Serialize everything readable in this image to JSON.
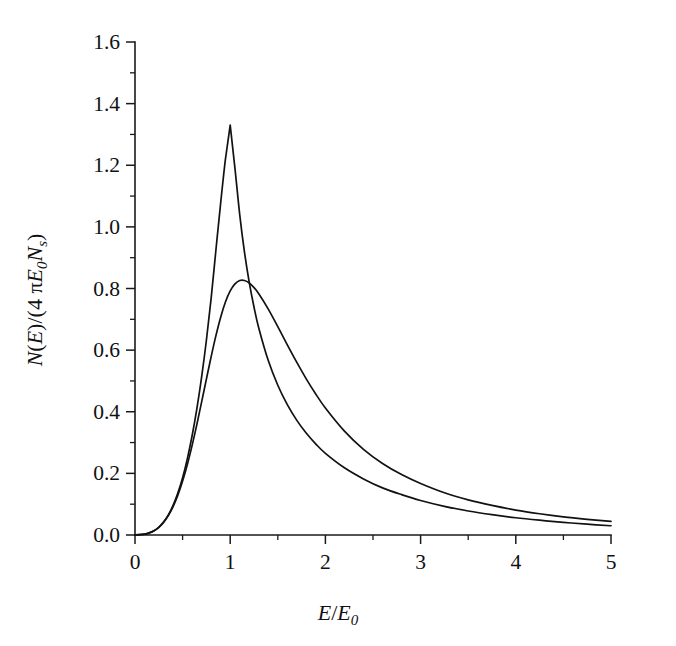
{
  "chart_data": {
    "type": "line",
    "title": "",
    "subtitle": "",
    "xlabel": "E/E_0",
    "xlabel_parts": {
      "numerator": "E",
      "slash": "/",
      "denominator": "E",
      "denominator_sub": "0"
    },
    "ylabel": "N(E)/(4 πE_0N_s)",
    "ylabel_parts": {
      "n": "N",
      "open": "(",
      "e": "E",
      "close": ")",
      "slash": "/",
      "paren_open": "(4 ",
      "pi": "π",
      "e0": "E",
      "e0_sub": "0",
      "ns": "N",
      "ns_sub": "s",
      "paren_close": ")"
    },
    "xlim": [
      0,
      5
    ],
    "ylim": [
      0.0,
      1.6
    ],
    "xticks": [
      0,
      1,
      2,
      3,
      4,
      5
    ],
    "xticklabels": [
      "0",
      "1",
      "2",
      "3",
      "4",
      "5"
    ],
    "yticks": [
      0.0,
      0.2,
      0.4,
      0.6,
      0.8,
      1.0,
      1.2,
      1.4,
      1.6
    ],
    "yticklabels": [
      "0.0",
      "0.2",
      "0.4",
      "0.6",
      "0.8",
      "1.0",
      "1.2",
      "1.4",
      "1.6"
    ],
    "x_minor_tick_interval": 0.5,
    "y_minor_tick_interval": 0.1,
    "grid": false,
    "legend": "none",
    "tick_direction": "out",
    "series": [
      {
        "name": "sharp-peak-curve",
        "peak_x": 1.0,
        "peak_y": 1.33,
        "x": [
          0.0,
          0.05,
          0.1,
          0.15,
          0.2,
          0.25,
          0.3,
          0.35,
          0.4,
          0.45,
          0.5,
          0.55,
          0.6,
          0.65,
          0.7,
          0.75,
          0.8,
          0.85,
          0.9,
          0.95,
          1.0,
          1.05,
          1.1,
          1.15,
          1.2,
          1.25,
          1.3,
          1.4,
          1.5,
          1.6,
          1.7,
          1.8,
          1.9,
          2.0,
          2.2,
          2.4,
          2.6,
          2.8,
          3.0,
          3.25,
          3.5,
          3.75,
          4.0,
          4.25,
          4.5,
          4.75,
          5.0
        ],
        "y": [
          0.0,
          0.001,
          0.003,
          0.007,
          0.014,
          0.025,
          0.042,
          0.065,
          0.096,
          0.136,
          0.186,
          0.248,
          0.322,
          0.41,
          0.513,
          0.632,
          0.769,
          0.925,
          1.078,
          1.22,
          1.33,
          1.19,
          1.04,
          0.918,
          0.82,
          0.74,
          0.672,
          0.566,
          0.486,
          0.423,
          0.372,
          0.33,
          0.295,
          0.265,
          0.218,
          0.182,
          0.153,
          0.131,
          0.112,
          0.093,
          0.078,
          0.066,
          0.056,
          0.048,
          0.041,
          0.035,
          0.03
        ]
      },
      {
        "name": "broad-peak-curve",
        "peak_x": 1.0,
        "peak_y": 0.83,
        "x": [
          0.0,
          0.05,
          0.1,
          0.15,
          0.2,
          0.25,
          0.3,
          0.35,
          0.4,
          0.45,
          0.5,
          0.55,
          0.6,
          0.65,
          0.7,
          0.75,
          0.8,
          0.85,
          0.9,
          0.95,
          1.0,
          1.05,
          1.1,
          1.15,
          1.2,
          1.25,
          1.3,
          1.4,
          1.5,
          1.6,
          1.7,
          1.8,
          1.9,
          2.0,
          2.2,
          2.4,
          2.6,
          2.8,
          3.0,
          3.25,
          3.5,
          3.75,
          4.0,
          4.25,
          4.5,
          4.75,
          5.0
        ],
        "y": [
          0.0,
          0.001,
          0.003,
          0.007,
          0.014,
          0.025,
          0.041,
          0.063,
          0.092,
          0.129,
          0.175,
          0.229,
          0.291,
          0.359,
          0.432,
          0.506,
          0.579,
          0.647,
          0.707,
          0.756,
          0.792,
          0.815,
          0.826,
          0.826,
          0.818,
          0.803,
          0.783,
          0.733,
          0.676,
          0.617,
          0.56,
          0.506,
          0.457,
          0.412,
          0.337,
          0.278,
          0.232,
          0.196,
          0.167,
          0.137,
          0.114,
          0.096,
          0.081,
          0.069,
          0.059,
          0.051,
          0.044
        ]
      }
    ]
  }
}
